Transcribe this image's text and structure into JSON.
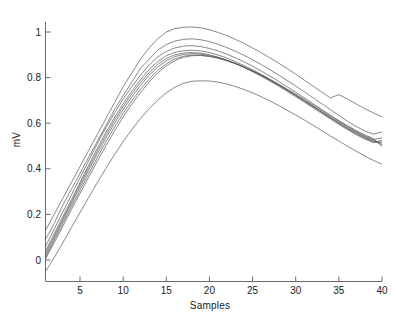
{
  "figure": {
    "background_color": "#ffffff",
    "line_color": "#555555",
    "axis_color": "#6b6b6b",
    "text_color": "#1a1a1a"
  },
  "chart_data": {
    "type": "line",
    "title": "",
    "xlabel": "Samples",
    "ylabel": "mV",
    "xlim": [
      1,
      40
    ],
    "ylim": [
      -0.09,
      1.07
    ],
    "grid": false,
    "legend": null,
    "xticks": [
      5,
      10,
      15,
      20,
      25,
      30,
      35,
      40
    ],
    "xticklabels": [
      "5",
      "10",
      "15",
      "20",
      "25",
      "30",
      "35",
      "40"
    ],
    "yticks": [
      0,
      0.2,
      0.4,
      0.6,
      0.8,
      1
    ],
    "yticklabels": [
      "0",
      "0.2",
      "0.4",
      "0.6",
      "0.8",
      "1"
    ],
    "x": [
      1,
      2,
      3,
      4,
      5,
      6,
      7,
      8,
      9,
      10,
      11,
      12,
      13,
      14,
      15,
      16,
      17,
      18,
      19,
      20,
      21,
      22,
      23,
      24,
      25,
      26,
      27,
      28,
      29,
      30,
      31,
      32,
      33,
      34,
      35,
      36,
      37,
      38,
      39,
      40
    ],
    "series": [
      {
        "name": "curve-1",
        "values": [
          0.13,
          0.2,
          0.27,
          0.34,
          0.41,
          0.48,
          0.55,
          0.62,
          0.69,
          0.76,
          0.82,
          0.88,
          0.93,
          0.97,
          1.0,
          1.015,
          1.021,
          1.022,
          1.018,
          1.01,
          0.998,
          0.984,
          0.968,
          0.95,
          0.93,
          0.909,
          0.887,
          0.864,
          0.84,
          0.815,
          0.789,
          0.763,
          0.737,
          0.711,
          0.725,
          0.706,
          0.685,
          0.664,
          0.645,
          0.628
        ]
      },
      {
        "name": "curve-2",
        "values": [
          0.09,
          0.16,
          0.24,
          0.31,
          0.38,
          0.45,
          0.52,
          0.59,
          0.66,
          0.72,
          0.78,
          0.84,
          0.88,
          0.92,
          0.945,
          0.96,
          0.968,
          0.97,
          0.966,
          0.958,
          0.946,
          0.932,
          0.916,
          0.898,
          0.878,
          0.857,
          0.835,
          0.812,
          0.788,
          0.763,
          0.738,
          0.712,
          0.686,
          0.66,
          0.634,
          0.609,
          0.586,
          0.566,
          0.552,
          0.562
        ]
      },
      {
        "name": "curve-3",
        "values": [
          0.06,
          0.135,
          0.21,
          0.285,
          0.36,
          0.435,
          0.51,
          0.58,
          0.645,
          0.705,
          0.76,
          0.81,
          0.855,
          0.89,
          0.915,
          0.93,
          0.938,
          0.94,
          0.936,
          0.928,
          0.917,
          0.903,
          0.887,
          0.869,
          0.85,
          0.829,
          0.807,
          0.784,
          0.76,
          0.736,
          0.711,
          0.686,
          0.66,
          0.635,
          0.61,
          0.586,
          0.564,
          0.544,
          0.528,
          0.536
        ]
      },
      {
        "name": "curve-4",
        "values": [
          0.04,
          0.115,
          0.19,
          0.265,
          0.34,
          0.415,
          0.49,
          0.56,
          0.625,
          0.685,
          0.74,
          0.79,
          0.835,
          0.87,
          0.896,
          0.911,
          0.918,
          0.92,
          0.917,
          0.91,
          0.899,
          0.886,
          0.87,
          0.853,
          0.834,
          0.814,
          0.792,
          0.77,
          0.746,
          0.722,
          0.698,
          0.673,
          0.648,
          0.623,
          0.599,
          0.575,
          0.553,
          0.534,
          0.518,
          0.524
        ]
      },
      {
        "name": "curve-5",
        "values": [
          0.03,
          0.105,
          0.18,
          0.255,
          0.33,
          0.405,
          0.478,
          0.548,
          0.613,
          0.673,
          0.728,
          0.778,
          0.822,
          0.858,
          0.884,
          0.9,
          0.908,
          0.91,
          0.907,
          0.9,
          0.89,
          0.877,
          0.862,
          0.845,
          0.826,
          0.806,
          0.785,
          0.763,
          0.74,
          0.716,
          0.692,
          0.668,
          0.643,
          0.619,
          0.595,
          0.572,
          0.55,
          0.531,
          0.515,
          0.518
        ]
      },
      {
        "name": "curve-6",
        "values": [
          0.02,
          0.095,
          0.17,
          0.245,
          0.32,
          0.393,
          0.465,
          0.535,
          0.6,
          0.66,
          0.715,
          0.765,
          0.81,
          0.846,
          0.874,
          0.892,
          0.902,
          0.905,
          0.903,
          0.897,
          0.888,
          0.876,
          0.862,
          0.846,
          0.828,
          0.809,
          0.788,
          0.767,
          0.744,
          0.721,
          0.697,
          0.673,
          0.649,
          0.625,
          0.601,
          0.578,
          0.557,
          0.538,
          0.522,
          0.512
        ]
      },
      {
        "name": "curve-7",
        "values": [
          0.01,
          0.085,
          0.16,
          0.233,
          0.306,
          0.378,
          0.449,
          0.518,
          0.583,
          0.643,
          0.698,
          0.748,
          0.793,
          0.831,
          0.861,
          0.882,
          0.894,
          0.899,
          0.898,
          0.893,
          0.885,
          0.874,
          0.861,
          0.845,
          0.828,
          0.809,
          0.789,
          0.768,
          0.746,
          0.723,
          0.7,
          0.676,
          0.652,
          0.628,
          0.605,
          0.582,
          0.561,
          0.542,
          0.526,
          0.505
        ]
      },
      {
        "name": "curve-8",
        "values": [
          0.005,
          0.075,
          0.148,
          0.22,
          0.292,
          0.363,
          0.433,
          0.501,
          0.566,
          0.627,
          0.683,
          0.734,
          0.78,
          0.82,
          0.852,
          0.875,
          0.889,
          0.896,
          0.897,
          0.893,
          0.886,
          0.876,
          0.863,
          0.848,
          0.831,
          0.813,
          0.793,
          0.772,
          0.75,
          0.728,
          0.705,
          0.681,
          0.658,
          0.634,
          0.611,
          0.589,
          0.568,
          0.549,
          0.533,
          0.498
        ]
      },
      {
        "name": "curve-9",
        "values": [
          -0.05,
          0.01,
          0.075,
          0.142,
          0.208,
          0.274,
          0.339,
          0.402,
          0.462,
          0.519,
          0.572,
          0.62,
          0.663,
          0.701,
          0.733,
          0.758,
          0.775,
          0.784,
          0.786,
          0.785,
          0.78,
          0.772,
          0.761,
          0.748,
          0.733,
          0.716,
          0.698,
          0.678,
          0.657,
          0.636,
          0.614,
          0.591,
          0.568,
          0.545,
          0.522,
          0.499,
          0.477,
          0.456,
          0.437,
          0.42
        ]
      }
    ]
  }
}
